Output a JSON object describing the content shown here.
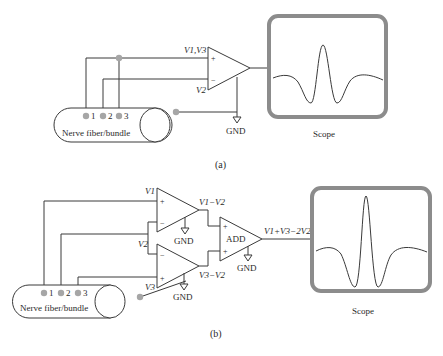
{
  "colors": {
    "line": "#3a3a3a",
    "electrode": "#a6a6a6",
    "scope_frame": "#8c8c8c",
    "background": "#ffffff"
  },
  "panel_a": {
    "caption": "(a)",
    "nerve_label": "Nerve fiber/bundle",
    "electrodes": [
      "1",
      "2",
      "3"
    ],
    "amp": {
      "plus_sign": "+",
      "minus_sign": "−",
      "plus_input_label": "V1,V3",
      "minus_input_label": "V2",
      "ground_label": "GND"
    },
    "scope_label": "Scope"
  },
  "panel_b": {
    "caption": "(b)",
    "nerve_label": "Nerve fiber/bundle",
    "electrodes": [
      "1",
      "2",
      "3"
    ],
    "amp_top": {
      "plus_sign": "+",
      "minus_sign": "−",
      "plus_input_label": "V1",
      "output_label": "V1−V2",
      "ground_label": "GND"
    },
    "amp_bottom": {
      "plus_sign": "+",
      "minus_sign": "−",
      "plus_input_label": "V3",
      "output_label": "V3−V2",
      "ground_label": "GND"
    },
    "shared_minus_label": "V2",
    "adder": {
      "label": "ADD",
      "plus_sign": "+",
      "output_label": "V1+V3−2V2",
      "ground_label": "GND"
    },
    "scope_label": "Scope"
  }
}
